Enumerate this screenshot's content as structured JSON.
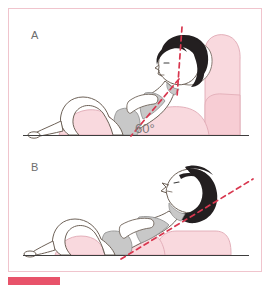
{
  "figure": {
    "panels": [
      {
        "id": "A",
        "label": "A",
        "annotation": "60°",
        "annotation_value": 60,
        "annotation_unit": "degrees",
        "description": "Person semi-reclined against a wedge backrest with head pillow; vertical red dashed reference line through the head and an oblique red dashed trunk line meeting the floor at 60 degrees.",
        "guide_lines": [
          "vertical-head-line",
          "oblique-trunk-line"
        ]
      },
      {
        "id": "B",
        "label": "B",
        "annotation": "",
        "description": "Person lying back on a low flat cushion with head extended; a single straight red dashed line runs from the hip through the trunk, neck and head.",
        "guide_lines": [
          "straight-trunk-head-line"
        ]
      }
    ]
  },
  "colors": {
    "frame_border": "#f0c4cd",
    "cushion_pink": "#f9d9de",
    "skin_outline": "#6e6258",
    "hair_dark": "#231f20",
    "shading_grey": "#c8c8c8",
    "dashed_line_red": "#d8374f",
    "ground_line": "#3d3d3d",
    "label_grey": "#6d6d6d",
    "caption_bar": "#e8536a",
    "background": "#ffffff"
  },
  "caption": {
    "bar_present": true,
    "text": ""
  }
}
